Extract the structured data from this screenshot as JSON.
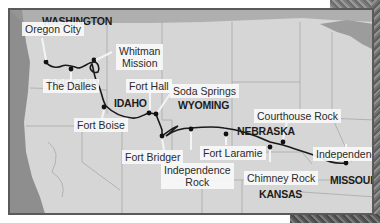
{
  "map": {
    "title": "Oregon Trail route map",
    "colors": {
      "ocean": "#8e8e8e",
      "land": "#d6d6d6",
      "lake": "#9c9c9c",
      "borders": "#a8a8a8",
      "route": "#1a1a1a",
      "frame": "#5a5a5a",
      "label_bg": "#f8f8f8"
    },
    "states": [
      {
        "name": "WASHINGTON"
      },
      {
        "name": "OREGON"
      },
      {
        "name": "IDAHO"
      },
      {
        "name": "WYOMING"
      },
      {
        "name": "NEBRASKA"
      },
      {
        "name": "KANSAS"
      },
      {
        "name": "MISSOURI"
      }
    ],
    "landmarks": [
      {
        "name": "Oregon City"
      },
      {
        "name": "The Dalles"
      },
      {
        "name": "Whitman Mission"
      },
      {
        "name": "Fort Boise"
      },
      {
        "name": "Fort Hall"
      },
      {
        "name": "Soda Springs"
      },
      {
        "name": "Fort Bridger"
      },
      {
        "name": "Independence Rock"
      },
      {
        "name": "Fort Laramie"
      },
      {
        "name": "Chimney Rock"
      },
      {
        "name": "Courthouse Rock"
      },
      {
        "name": "Independence"
      }
    ],
    "landmark_lines": {
      "whitman_1": "Whitman",
      "whitman_2": "Mission",
      "indrock_1": "Independence",
      "indrock_2": "Rock"
    }
  }
}
